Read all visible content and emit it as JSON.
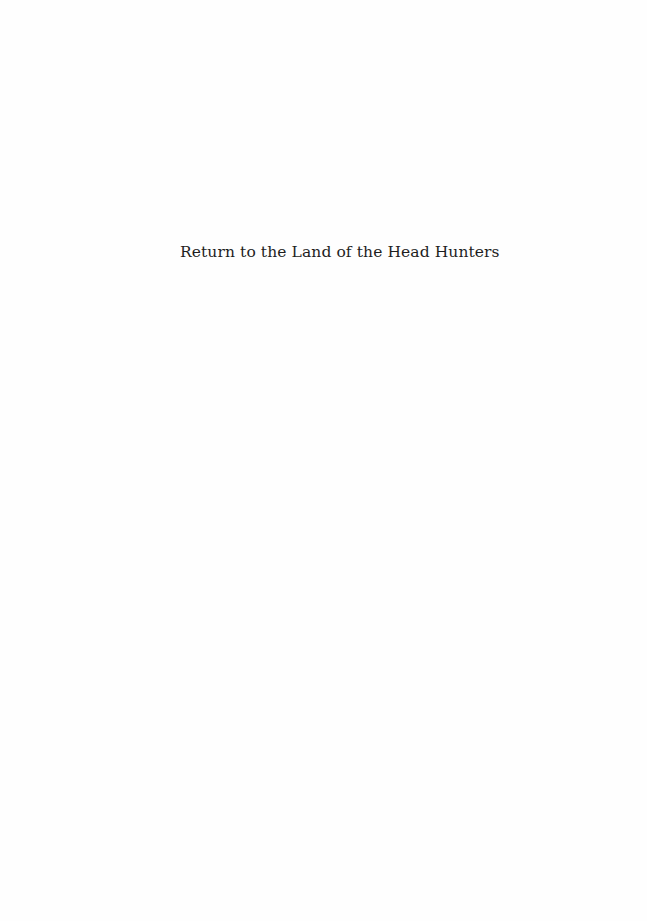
{
  "page": {
    "half_title": "Return to the Land of the Head Hunters"
  }
}
